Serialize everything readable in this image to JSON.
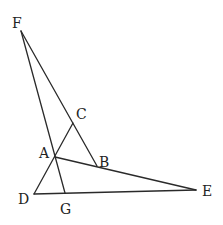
{
  "diagram": {
    "type": "geometry",
    "points": {
      "F": {
        "x": 21,
        "y": 31,
        "label": "F",
        "lx": 12,
        "ly": 28
      },
      "C": {
        "x": 73,
        "y": 123,
        "label": "C",
        "lx": 76,
        "ly": 119
      },
      "A": {
        "x": 55,
        "y": 157,
        "label": "A",
        "lx": 39,
        "ly": 158
      },
      "B": {
        "x": 97,
        "y": 166,
        "label": "B",
        "lx": 99,
        "ly": 167
      },
      "D": {
        "x": 34,
        "y": 194,
        "label": "D",
        "lx": 18,
        "ly": 204
      },
      "G": {
        "x": 65,
        "y": 193,
        "label": "G",
        "lx": 60,
        "ly": 214
      },
      "E": {
        "x": 196,
        "y": 190,
        "label": "E",
        "lx": 202,
        "ly": 196
      }
    },
    "segments": [
      [
        "F",
        "G"
      ],
      [
        "F",
        "B"
      ],
      [
        "D",
        "C"
      ],
      [
        "A",
        "E"
      ],
      [
        "D",
        "E"
      ]
    ]
  }
}
